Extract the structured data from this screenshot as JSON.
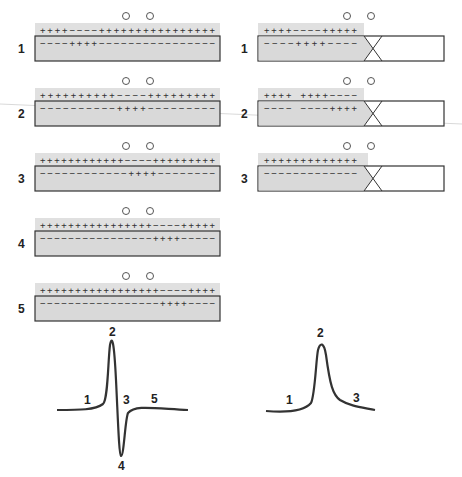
{
  "left_panel": {
    "title": "Continuous conduction (biphasic)",
    "rows": [
      {
        "label": "1",
        "outer": "++++−−−−++++++++++++++++",
        "inner": "−−−−++++−−−−−−−−−−−−−−−−"
      },
      {
        "label": "2",
        "outer": "++++++++++−−−−+++++++++",
        "inner": "−−−−−−−−−−++++−−−−−−−−−"
      },
      {
        "label": "3",
        "outer": "++++++++++++−−−−+++++++++",
        "inner": "−−−−−−−−−−−−++++−−−−−−−−"
      },
      {
        "label": "4",
        "outer": "++++++++++++++++−−−−+++++",
        "inner": "−−−−−−−−−−−−−−−−++++−−−−−"
      },
      {
        "label": "5",
        "outer": "+++++++++++++++++−−−−++++",
        "inner": "−−−−−−−−−−−−−−−−−++++−−−−"
      }
    ],
    "waveform": {
      "labels": [
        "1",
        "2",
        "3",
        "4",
        "5"
      ]
    }
  },
  "right_panel": {
    "title": "Conduction blocked (monophasic)",
    "rows": [
      {
        "label": "1",
        "outer": "++++−−−−+++++",
        "inner": "−−−−++++−−−−"
      },
      {
        "label": "2",
        "outer": "++++ ++++−−−−",
        "inner": "−−−− −−−−++++"
      },
      {
        "label": "3",
        "outer": "+++++++++++++",
        "inner": "−−−−−−−−−−−−−"
      }
    ],
    "waveform": {
      "labels": [
        "1",
        "2",
        "3"
      ]
    }
  },
  "colors": {
    "fiber_fill": "#d9d9d9",
    "strip_fill": "#e0e0e0",
    "stroke": "#333333",
    "electrode": "#555555"
  }
}
